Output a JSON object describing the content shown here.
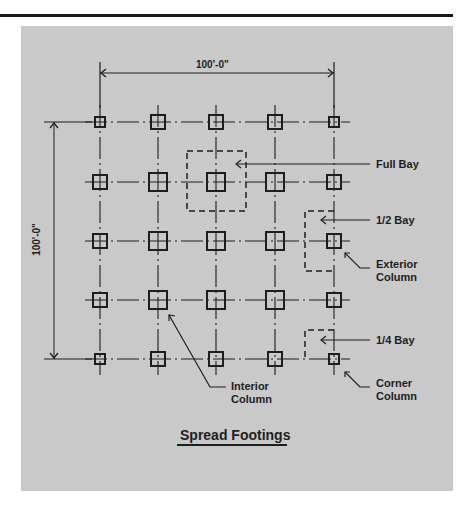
{
  "figure": {
    "title": "Spread Footings",
    "dimension_horizontal": "100'-0\"",
    "dimension_vertical": "100'-0\"",
    "grid": {
      "columns_x": [
        100,
        158,
        216,
        275,
        334
      ],
      "rows_y": [
        122,
        182,
        241,
        300,
        359
      ],
      "footing_types": {
        "corner": "small",
        "exterior": "medium",
        "interior": "large"
      }
    },
    "labels": {
      "full_bay": "Full Bay",
      "half_bay": "1/2 Bay",
      "exterior_column_line1": "Exterior",
      "exterior_column_line2": "Column",
      "quarter_bay": "1/4 Bay",
      "corner_column_line1": "Corner",
      "corner_column_line2": "Column",
      "interior_column_line1": "Interior",
      "interior_column_line2": "Column"
    },
    "colors": {
      "background": "#c9c9c9",
      "ink": "#1e1e1e",
      "rule": "#1a1a1a"
    }
  }
}
